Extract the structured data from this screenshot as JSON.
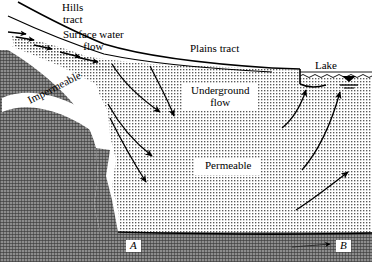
{
  "figure": {
    "kind": "hydrogeological-cross-section",
    "width": 373,
    "height": 265,
    "background_color": "#ffffff",
    "line_color": "#000000"
  },
  "labels": {
    "hills_tract": "Hills\ntract",
    "surface_water_flow": "Surface water\nflow",
    "plains_tract": "Plains tract",
    "lake": "Lake",
    "underground_flow": "Underground\nflow",
    "permeable": "Permeable",
    "impermeable": "Impermeable",
    "point_a": "A",
    "point_b": "B"
  },
  "units": [
    {
      "name": "permeable",
      "label": "Permeable",
      "pattern": "fine-dotted-stipple",
      "fill_color": "#d8d8d8"
    },
    {
      "name": "impermeable",
      "label": "Impermeable",
      "pattern": "dark-crosshatch",
      "fill_color": "#6e6e6e"
    },
    {
      "name": "lake",
      "label": "Lake",
      "pattern": "wavy-water-surface",
      "fill_color": "#ffffff"
    }
  ],
  "flow": {
    "surface_arrows_count": 5,
    "surface_direction": "downslope-right",
    "recharge_arrows_count": 4,
    "recharge_direction": "downward-right",
    "discharge_arrows_count": 3,
    "discharge_direction": "upward-right-toward-lake",
    "basal_arrow_count": 1
  },
  "markers": [
    {
      "id": "A",
      "label": "A",
      "position": "base-left"
    },
    {
      "id": "B",
      "label": "B",
      "position": "base-right"
    }
  ]
}
